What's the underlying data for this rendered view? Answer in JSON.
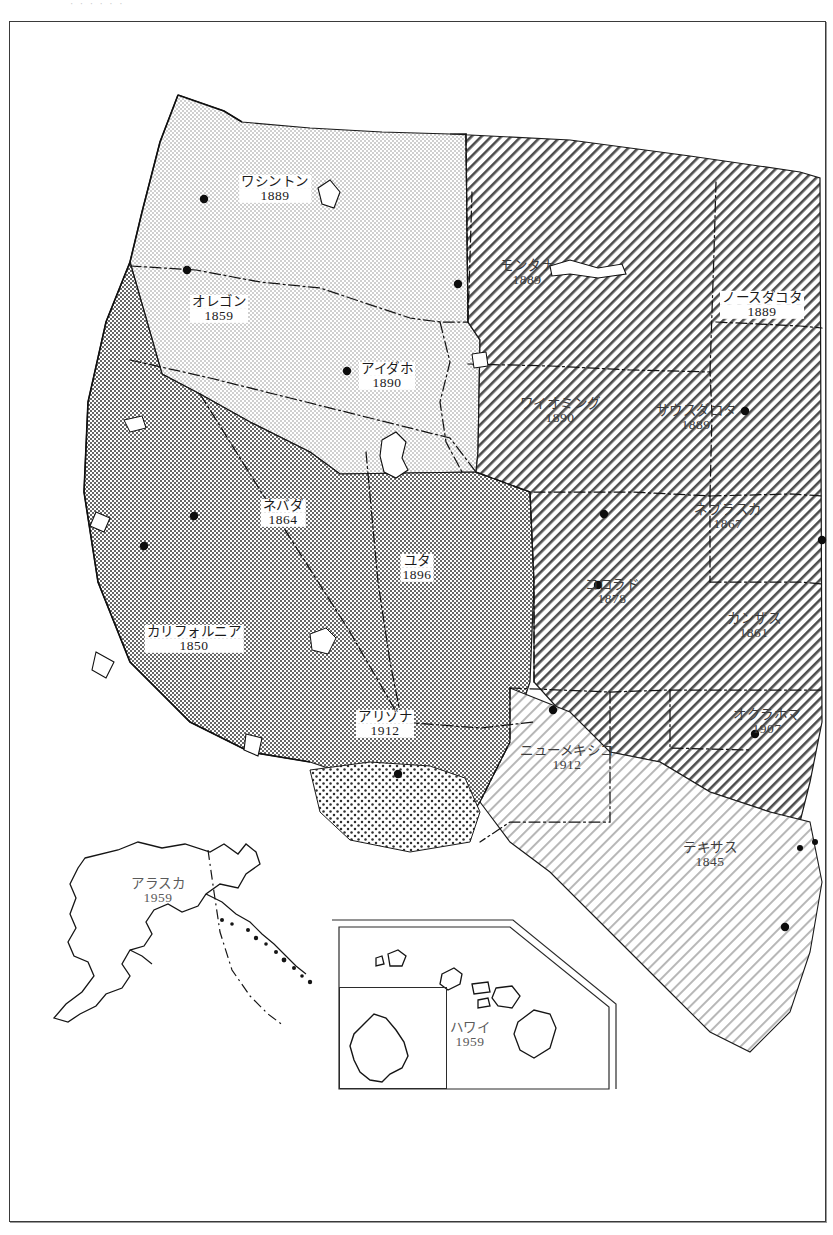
{
  "page": {
    "top_caption": "· · · · ·  ·  ",
    "frame_color": "#3a3a3a",
    "background": "#ffffff"
  },
  "map": {
    "title": "西部アメリカ合衆国 州の成立年",
    "region": "Western United States",
    "label_language": "Japanese (katakana)",
    "states": [
      {
        "id": "washington",
        "name": "ワシントン",
        "year": "1889",
        "x": 265,
        "y": 167,
        "style": "boxed",
        "fill": "light-stipple"
      },
      {
        "id": "oregon",
        "name": "オレゴン",
        "year": "1859",
        "x": 209,
        "y": 287,
        "style": "boxed",
        "fill": "light-stipple"
      },
      {
        "id": "idaho",
        "name": "アイダホ",
        "year": "1890",
        "x": 377,
        "y": 354,
        "style": "boxed",
        "fill": "light-stipple"
      },
      {
        "id": "montana",
        "name": "モンタナ",
        "year": "1889",
        "x": 517,
        "y": 251,
        "style": "plain",
        "fill": "diagonal-hatch"
      },
      {
        "id": "north-dakota",
        "name": "ノースダコタ",
        "year": "1889",
        "x": 752,
        "y": 283,
        "style": "boxed",
        "fill": "diagonal-hatch"
      },
      {
        "id": "wyoming",
        "name": "ワイオミング",
        "year": "1890",
        "x": 550,
        "y": 389,
        "style": "plain",
        "fill": "diagonal-hatch"
      },
      {
        "id": "south-dakota",
        "name": "サウスダコタ",
        "year": "1889",
        "x": 686,
        "y": 396,
        "style": "plain",
        "fill": "diagonal-hatch"
      },
      {
        "id": "nebraska",
        "name": "ネブラスカ",
        "year": "1867",
        "x": 718,
        "y": 495,
        "style": "plain",
        "fill": "diagonal-hatch"
      },
      {
        "id": "colorado",
        "name": "コロラド",
        "year": "1878",
        "x": 602,
        "y": 570,
        "style": "plain",
        "fill": "diagonal-hatch"
      },
      {
        "id": "kansas",
        "name": "カンザス",
        "year": "1861",
        "x": 744,
        "y": 604,
        "style": "plain",
        "fill": "diagonal-hatch"
      },
      {
        "id": "nevada",
        "name": "ネバダ",
        "year": "1864",
        "x": 273,
        "y": 491,
        "style": "boxed",
        "fill": "dark-stipple"
      },
      {
        "id": "utah",
        "name": "ユタ",
        "year": "1896",
        "x": 407,
        "y": 546,
        "style": "boxed",
        "fill": "dark-stipple"
      },
      {
        "id": "california",
        "name": "カリフォルニア",
        "year": "1850",
        "x": 184,
        "y": 617,
        "style": "boxed",
        "fill": "dark-stipple"
      },
      {
        "id": "arizona",
        "name": "アリゾナ",
        "year": "1912",
        "x": 375,
        "y": 702,
        "style": "boxed",
        "fill": "dark-stipple"
      },
      {
        "id": "oklahoma",
        "name": "オクラホマ",
        "year": "1907",
        "x": 757,
        "y": 700,
        "style": "plain",
        "fill": "diagonal-hatch"
      },
      {
        "id": "new-mexico",
        "name": "ニューメキシコ",
        "year": "1912",
        "x": 557,
        "y": 736,
        "style": "plain",
        "fill": "light-hatch"
      },
      {
        "id": "texas",
        "name": "テキサス",
        "year": "1845",
        "x": 700,
        "y": 833,
        "style": "plain",
        "fill": "light-hatch"
      }
    ],
    "insets": [
      {
        "id": "alaska",
        "name": "アラスカ",
        "year": "1959",
        "x": 148,
        "y": 869,
        "box": {
          "left": 39,
          "top": 814,
          "width": 288,
          "height": 253
        }
      },
      {
        "id": "hawaii",
        "name": "ハワイ",
        "year": "1959",
        "x": 460,
        "y": 1013,
        "box": {
          "left": 329,
          "top": 904,
          "width": 270,
          "height": 163
        }
      },
      {
        "id": "oahu",
        "name": "",
        "year": "",
        "x": 0,
        "y": 0,
        "box": {
          "left": 329,
          "top": 965,
          "width": 108,
          "height": 102
        }
      }
    ],
    "fill_legend": [
      {
        "key": "light-stipple",
        "label": "light gray stipple",
        "color": "#c9c9c9"
      },
      {
        "key": "dark-stipple",
        "label": "dark gray stipple",
        "color": "#8e8e8e"
      },
      {
        "key": "diagonal-hatch",
        "label": "diagonal hatching",
        "color": "#555555"
      },
      {
        "key": "light-hatch",
        "label": "light diagonal hatch",
        "color": "#a8a8a8"
      },
      {
        "key": "dot-pattern",
        "label": "coarse dot pattern",
        "color": "#3a3a3a"
      }
    ]
  }
}
